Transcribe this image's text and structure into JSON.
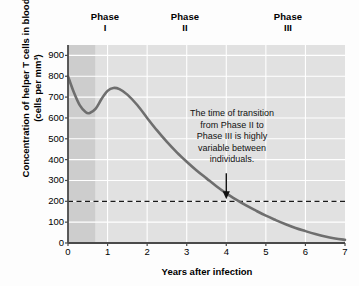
{
  "chart_data": {
    "type": "line",
    "title": "",
    "xlabel": "Years after infection",
    "ylabel_line1": "Concentration of helper T cells in blood",
    "ylabel_line2": "(cells per mm³)",
    "xlim": [
      0,
      7
    ],
    "ylim": [
      0,
      950
    ],
    "xticks": [
      0,
      1,
      2,
      3,
      4,
      5,
      6,
      7
    ],
    "yticks": [
      0,
      100,
      200,
      300,
      400,
      500,
      600,
      700,
      800,
      900
    ],
    "grid": true,
    "legend": "none",
    "series": [
      {
        "name": "Helper T cell concentration",
        "color": "#6e6e6e",
        "x": [
          0.0,
          0.15,
          0.3,
          0.45,
          0.55,
          0.7,
          0.85,
          1.0,
          1.15,
          1.3,
          1.5,
          1.75,
          2.0,
          2.25,
          2.5,
          2.75,
          3.0,
          3.25,
          3.5,
          3.75,
          4.0,
          4.25,
          4.5,
          4.75,
          5.0,
          5.25,
          5.5,
          5.75,
          6.0,
          6.25,
          6.5,
          6.75,
          7.0
        ],
        "values": [
          800,
          722,
          660,
          627,
          624,
          645,
          692,
          730,
          744,
          738,
          712,
          662,
          600,
          540,
          485,
          435,
          390,
          348,
          310,
          272,
          238,
          208,
          180,
          155,
          131,
          110,
          90,
          72,
          57,
          43,
          31,
          22,
          15
        ]
      }
    ],
    "reference_lines": [
      {
        "name": "threshold-200",
        "axis": "y",
        "value": 200,
        "style": "dashed",
        "color": "#1a1a1a"
      }
    ],
    "shaded_bands": [
      {
        "name": "phase-1-band",
        "x_start": 0.0,
        "x_end": 0.7,
        "color": "#cdcdcd"
      },
      {
        "name": "phase-2-3-band",
        "x_start": 0.7,
        "x_end": 7.0,
        "color": "#e1e1e1"
      }
    ],
    "annotations": [
      {
        "name": "transition-note",
        "lines": [
          "The time of transition",
          "from Phase II to",
          "Phase III is highly",
          "variable between",
          "individuals."
        ],
        "arrow_target_x": 4.0,
        "arrow_target_y": 200
      }
    ],
    "phase_headers": [
      {
        "name": "Phase",
        "numeral": "I",
        "x_center": 0.95
      },
      {
        "name": "Phase",
        "numeral": "II",
        "x_center": 2.95
      },
      {
        "name": "Phase",
        "numeral": "III",
        "x_center": 5.55
      }
    ]
  },
  "colors": {
    "curve": "#6e6e6e",
    "plot_background": "#e1e1e1",
    "phase1_background": "#cdcdcd",
    "gridline": "#ffffff",
    "axis": "#4a4a4a",
    "text": "#000000",
    "page_background": "#fdfdfd"
  }
}
